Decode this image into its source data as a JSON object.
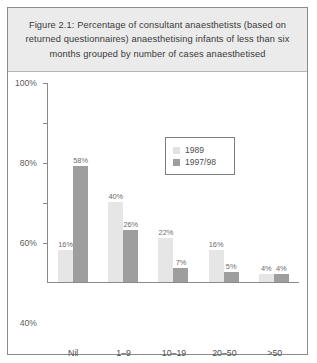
{
  "figure": {
    "title": "Figure 2.1: Percentage of consultant anaesthetists (based on returned questionnaires) anaesthetising infants of less than six months grouped by number of cases anaesthetised"
  },
  "chart_data": {
    "type": "bar",
    "title": "Figure 2.1: Percentage of consultant anaesthetists (based on returned questionnaires) anaesthetising infants of less than six months grouped by number of cases anaesthetised",
    "xlabel": "Annual number of anaesthetics given to infants of less than six months",
    "ylabel": "",
    "ylim": [
      0,
      100
    ],
    "grid": false,
    "legend_position": "inside-top-right",
    "categories": [
      "Nil",
      "1–9",
      "10–19",
      "20–50",
      ">50"
    ],
    "tick_labels": [
      "20%",
      "40%",
      "60%",
      "80%",
      "100%"
    ],
    "tick_values": [
      20,
      40,
      60,
      80,
      100
    ],
    "series": [
      {
        "name": "1989",
        "color": "#e6e6e6",
        "values": [
          16,
          40,
          22,
          16,
          4
        ],
        "labels": [
          "16%",
          "40%",
          "22%",
          "16%",
          "4%"
        ]
      },
      {
        "name": "1997/98",
        "color": "#9e9e9e",
        "values": [
          58,
          26,
          7,
          5,
          4
        ],
        "labels": [
          "58%",
          "26%",
          "7%",
          "5%",
          "4%"
        ]
      }
    ]
  },
  "legend": {
    "entries": [
      {
        "label": "1989"
      },
      {
        "label": "1997/98"
      }
    ]
  },
  "caption": {
    "text": "Annual number of anaesthetics given to infants of less than six months"
  }
}
